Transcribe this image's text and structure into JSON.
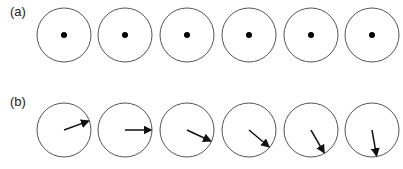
{
  "panels": [
    {
      "label": "(a)",
      "description": "Six circles each with a center dot"
    },
    {
      "label": "(b)",
      "description": "Six circles each with an arrow from center rotating clockwise"
    }
  ],
  "arrow_angles_deg": [
    -20,
    0,
    25,
    40,
    60,
    80
  ],
  "colors": {
    "circle": "#555555",
    "dot": "#000000",
    "arrow": "#111111"
  }
}
